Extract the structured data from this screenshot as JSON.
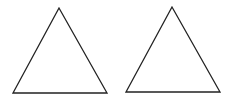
{
  "diagram": {
    "width": 233,
    "height": 105,
    "background": "#ffffff",
    "stroke_color": "#222222",
    "stroke_width": 1.3,
    "shapes": [
      {
        "type": "triangle",
        "name": "left-triangle",
        "points": "59,8 13,93 107,93"
      },
      {
        "type": "triangle",
        "name": "right-triangle",
        "points": "172,7 126,92 220,92"
      }
    ]
  }
}
